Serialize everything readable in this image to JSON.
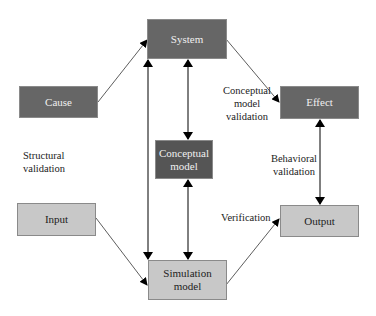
{
  "nodes": {
    "system": {
      "label": "System"
    },
    "cause": {
      "label": "Cause"
    },
    "effect": {
      "label": "Effect"
    },
    "conceptual": {
      "line1": "Conceptual",
      "line2": "model"
    },
    "input": {
      "label": "Input"
    },
    "output": {
      "label": "Output"
    },
    "simulation": {
      "line1": "Simulation",
      "line2": "model"
    }
  },
  "labels": {
    "conceptual_validation": {
      "line1": "Conceptual",
      "line2": "model",
      "line3": "validation"
    },
    "structural_validation": {
      "line1": "Structural",
      "line2": "validation"
    },
    "behavioral_validation": {
      "line1": "Behavioral",
      "line2": "validation"
    },
    "verification": "Verification"
  },
  "colors": {
    "dark_box": "#666666",
    "darker_box": "#555555",
    "light_box": "#c8c8c8",
    "arrow": "#000000"
  }
}
